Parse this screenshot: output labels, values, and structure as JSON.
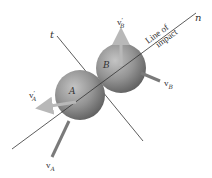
{
  "diagram": {
    "axes": {
      "tangent_label": "t",
      "normal_label": "n",
      "line_of_impact_line1": "Line of",
      "line_of_impact_line2": "impact"
    },
    "bodies": [
      {
        "id": "A",
        "label": "A",
        "color": "#8a8a8a"
      },
      {
        "id": "B",
        "label": "B",
        "color": "#8a8a8a"
      }
    ],
    "vectors": {
      "vA": {
        "label": "v",
        "sub": "A",
        "prime": ""
      },
      "vB": {
        "label": "v",
        "sub": "B",
        "prime": ""
      },
      "vA_prime": {
        "label": "v",
        "sub": "A",
        "prime": "′"
      },
      "vB_prime": {
        "label": "v",
        "sub": "B",
        "prime": "′"
      }
    },
    "colors": {
      "line": "#333333",
      "sphere_light": "#c8c8c8",
      "sphere_dark": "#6a6a6a",
      "before_arrow": "#7a7a7a",
      "after_arrow": "#b5b5b5"
    }
  }
}
